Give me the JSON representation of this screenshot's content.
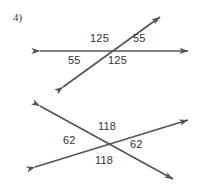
{
  "page": {
    "width": 205,
    "height": 189,
    "background": "#ffffff",
    "stroke_color": "#555555",
    "text_color": "#333333"
  },
  "problem": {
    "number_label": "4)"
  },
  "figures": [
    {
      "name": "top-figure",
      "description": "A horizontal line crossed by a diagonal line rising to the upper right, with four angle measures labeled around the intersection.",
      "lines": [
        {
          "name": "horizontal-transversal",
          "x1": 40,
          "y1": 51,
          "x2": 188,
          "y2": 51,
          "arrow_start": true,
          "arrow_end": true
        },
        {
          "name": "diagonal-line",
          "x1": 63,
          "y1": 87,
          "x2": 160,
          "y2": 17,
          "arrow_start": true,
          "arrow_end": true
        }
      ],
      "labels": [
        {
          "name": "angle-top-left",
          "text": "125",
          "x": 90,
          "y": 33
        },
        {
          "name": "angle-top-right",
          "text": "55",
          "x": 133,
          "y": 33
        },
        {
          "name": "angle-bottom-left",
          "text": "55",
          "x": 68,
          "y": 55
        },
        {
          "name": "angle-bottom-right",
          "text": "125",
          "x": 108,
          "y": 55
        }
      ]
    },
    {
      "name": "bottom-figure",
      "description": "Two lines crossing in an X shape with four angle measures labeled around the intersection.",
      "lines": [
        {
          "name": "line-rising-right",
          "x1": 35,
          "y1": 167,
          "x2": 188,
          "y2": 120,
          "arrow_start": true,
          "arrow_end": true
        },
        {
          "name": "line-falling-right",
          "x1": 40,
          "y1": 106,
          "x2": 173,
          "y2": 179,
          "arrow_start": true,
          "arrow_end": true
        }
      ],
      "labels": [
        {
          "name": "angle-top",
          "text": "118",
          "x": 98,
          "y": 121
        },
        {
          "name": "angle-left",
          "text": "62",
          "x": 63,
          "y": 135
        },
        {
          "name": "angle-right",
          "text": "62",
          "x": 130,
          "y": 139
        },
        {
          "name": "angle-bottom",
          "text": "118",
          "x": 95,
          "y": 155
        }
      ]
    }
  ]
}
